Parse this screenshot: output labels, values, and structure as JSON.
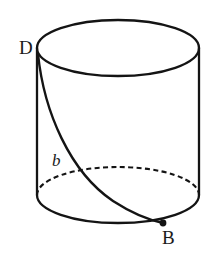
{
  "figure": {
    "kind": "geometry-diagram",
    "background_color": "#ffffff",
    "stroke_color": "#141414",
    "labels": [
      {
        "id": "D",
        "text": "D",
        "role": "vertex-label-top-left",
        "x": 19,
        "y": 38
      },
      {
        "id": "b",
        "text": "b",
        "role": "curve-length-label",
        "x": 52,
        "y": 152,
        "style": "italic"
      },
      {
        "id": "B",
        "text": "B",
        "role": "vertex-label-bottom-right",
        "x": 162,
        "y": 228
      }
    ],
    "geometry": {
      "top_ellipse": {
        "cx": 118,
        "cy": 48,
        "rx": 81,
        "ry": 28,
        "style": "solid"
      },
      "bottom_ellipse": {
        "cx": 118,
        "cy": 195,
        "rx": 81,
        "ry": 28,
        "front_half_style": "solid",
        "back_half_style": "dashed"
      },
      "left_side": {
        "x1": 37,
        "y1": 48,
        "x2": 37,
        "y2": 195
      },
      "right_side": {
        "x1": 199,
        "y1": 48,
        "x2": 199,
        "y2": 195
      },
      "geodesic_curve": {
        "from_point": "D",
        "to_point": "B",
        "from_xy": [
          38,
          54
        ],
        "to_xy": [
          163,
          223
        ],
        "style": "solid"
      },
      "point_marker": {
        "at": "B",
        "x": 163,
        "y": 223,
        "r": 3.4
      }
    },
    "dash_pattern": "5 3.4"
  }
}
